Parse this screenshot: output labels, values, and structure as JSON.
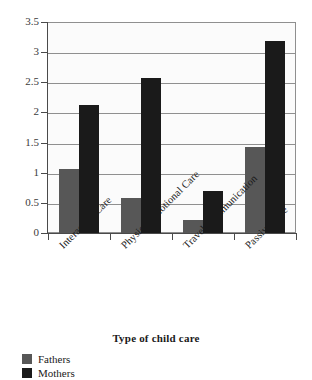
{
  "chart_data": {
    "type": "bar",
    "title": "",
    "subtitle": "",
    "xlabel": "Type of child care",
    "ylabel": "",
    "categories": [
      "Interactive Care",
      "Physical/emotional Care",
      "Travel/Communication",
      "Passive Care"
    ],
    "series": [
      {
        "name": "Fathers",
        "color": "#575757",
        "values": [
          1.06,
          0.58,
          0.21,
          1.43
        ]
      },
      {
        "name": "Mothers",
        "color": "#1a1a1a",
        "values": [
          2.12,
          2.57,
          0.7,
          3.18
        ]
      }
    ],
    "ylim": [
      0,
      3.5
    ],
    "ytick_values": [
      0,
      0.5,
      1,
      1.5,
      2,
      2.5,
      3,
      3.5
    ],
    "ytick_labels": [
      "0",
      "0.5",
      "1",
      "1.5",
      "2",
      "2.5",
      "3",
      "3.5"
    ],
    "grid": true,
    "grid_axis": "y",
    "legend_position": "bottom-left",
    "legend_entries": [
      "Fathers",
      "Mothers"
    ],
    "annotations": [],
    "bar_orientation": "vertical",
    "category_label_rotation": -45
  },
  "axis": {
    "x_title": "Type of child care"
  },
  "legend": {
    "items": [
      {
        "label": "Fathers",
        "color": "#575757"
      },
      {
        "label": "Mothers",
        "color": "#1a1a1a"
      }
    ]
  },
  "colors": {
    "fathers": "#575757",
    "mothers": "#1a1a1a",
    "grid": "#8f8f8f",
    "axis": "#4a4a4a",
    "plot_background": "#fbfbfb",
    "figure_background": "#ffffff"
  }
}
